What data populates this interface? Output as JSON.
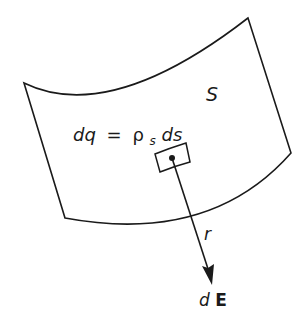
{
  "diagram": {
    "type": "surface-charge-field",
    "colors": {
      "stroke": "#1a1a1a",
      "background": "#ffffff"
    },
    "surface": {
      "label": "S",
      "corners": {
        "top_left": [
          24,
          83
        ],
        "top_right": [
          248,
          18
        ],
        "right": [
          291,
          153
        ],
        "bottom_left": [
          65,
          218
        ]
      }
    },
    "element": {
      "equation": {
        "lhs": "dq",
        "equals": "=",
        "rho": "ρ",
        "subscript": "s",
        "rhs_tail": "ds"
      },
      "charge_point": [
        172,
        158
      ]
    },
    "vector": {
      "distance_label": "r",
      "field_label_d": "d",
      "field_label_E": "E",
      "tip": [
        212,
        285
      ]
    }
  }
}
